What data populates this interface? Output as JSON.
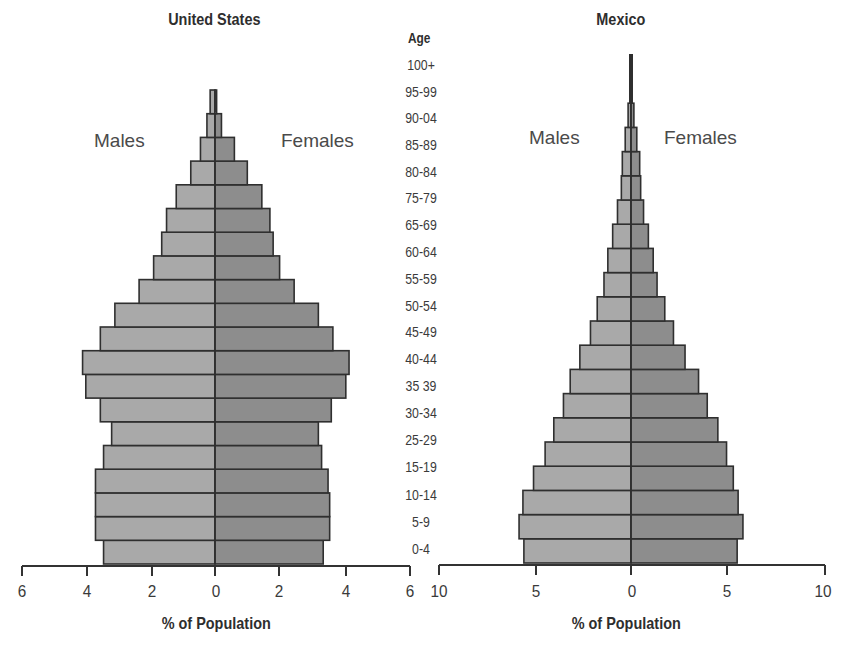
{
  "chart_data": [
    {
      "type": "bar",
      "subtype": "population-pyramid",
      "title": "United States",
      "xlabel": "% of Population",
      "ylabel": "Age",
      "xlim": [
        -6,
        6
      ],
      "x_ticks": [
        6,
        4,
        2,
        0,
        2,
        4,
        6
      ],
      "legend": [
        "Males",
        "Females"
      ],
      "grid": false,
      "bars_bottom_to_top": 20,
      "series": [
        {
          "name": "Males",
          "values": [
            3.45,
            3.7,
            3.7,
            3.7,
            3.45,
            3.2,
            3.55,
            4.0,
            4.1,
            3.55,
            3.1,
            2.35,
            1.9,
            1.65,
            1.5,
            1.2,
            0.75,
            0.45,
            0.25,
            0.15
          ]
        },
        {
          "name": "Females",
          "values": [
            3.35,
            3.55,
            3.55,
            3.5,
            3.3,
            3.2,
            3.6,
            4.05,
            4.15,
            3.65,
            3.2,
            2.45,
            2.0,
            1.8,
            1.7,
            1.45,
            1.0,
            0.6,
            0.2,
            0.05
          ]
        }
      ]
    },
    {
      "type": "bar",
      "subtype": "population-pyramid",
      "title": "Mexico",
      "xlabel": "% of Population",
      "ylabel": "Age",
      "xlim": [
        -10,
        10
      ],
      "x_ticks": [
        10,
        5,
        0,
        5,
        10
      ],
      "legend": [
        "Males",
        "Females"
      ],
      "grid": false,
      "bars_bottom_to_top": 21,
      "series": [
        {
          "name": "Males",
          "values": [
            5.55,
            5.8,
            5.6,
            5.05,
            4.45,
            4.0,
            3.5,
            3.15,
            2.65,
            2.1,
            1.75,
            1.4,
            1.2,
            0.95,
            0.7,
            0.5,
            0.45,
            0.3,
            0.15,
            0.05,
            0.05
          ]
        },
        {
          "name": "Females",
          "values": [
            5.5,
            5.8,
            5.55,
            5.3,
            4.95,
            4.5,
            3.95,
            3.5,
            2.8,
            2.2,
            1.75,
            1.35,
            1.15,
            0.9,
            0.65,
            0.5,
            0.45,
            0.3,
            0.15,
            0.05,
            0.05
          ]
        }
      ]
    }
  ],
  "age_axis": {
    "heading": "Age",
    "labels": [
      "100+",
      "95-99",
      "90-04",
      "85-89",
      "80-84",
      "75-79",
      "65-69",
      "60-64",
      "55-59",
      "50-54",
      "45-49",
      "40-44",
      "35 39",
      "30-34",
      "25-29",
      "15-19",
      "10-14",
      "5-9",
      "0-4"
    ]
  },
  "us": {
    "title": "United States",
    "males_label": "Males",
    "females_label": "Females",
    "ticks": [
      "6",
      "4",
      "2",
      "0",
      "2",
      "4",
      "6"
    ],
    "axis_title": "% of Population"
  },
  "mexico": {
    "title": "Mexico",
    "males_label": "Males",
    "females_label": "Females",
    "ticks": [
      "10",
      "5",
      "0",
      "5",
      "10"
    ],
    "axis_title": "% of Population"
  },
  "colors": {
    "male_fill": "#a9a9a9",
    "female_fill": "#8d8d8d",
    "outline": "#2f2f2f",
    "axis": "#333333"
  }
}
